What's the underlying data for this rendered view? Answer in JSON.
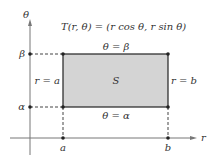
{
  "diagram": {
    "title": "T(r, θ) = (r cos θ, r sin θ)",
    "axes": {
      "vertical_label": "θ",
      "horizontal_label": "r"
    },
    "region_label": "S",
    "edges": {
      "top": "θ = β",
      "bottom": "θ = α",
      "left": "r = a",
      "right": "r = b"
    },
    "tick_labels": {
      "beta": "β",
      "alpha": "α",
      "a": "a",
      "b": "b"
    },
    "colors": {
      "fill": "#d4d4d4",
      "stroke": "#222222",
      "axis": "#777777"
    }
  }
}
